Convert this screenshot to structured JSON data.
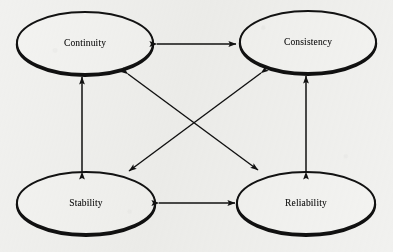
{
  "diagram": {
    "background_color": "#f1f1ef",
    "stroke_color": "#111111",
    "text_color": "#151515",
    "nodes": [
      {
        "id": "continuity",
        "label": "Continuity",
        "cx": 85,
        "cy": 43,
        "rx": 68,
        "ry": 31
      },
      {
        "id": "consistency",
        "label": "Consistency",
        "cx": 308,
        "cy": 42,
        "rx": 68,
        "ry": 31
      },
      {
        "id": "stability",
        "label": "Stability",
        "cx": 86,
        "cy": 203,
        "rx": 69,
        "ry": 31
      },
      {
        "id": "reliability",
        "label": "Reliability",
        "cx": 306,
        "cy": 203,
        "rx": 69,
        "ry": 31
      }
    ],
    "edges": [
      {
        "id": "continuity-consistency",
        "from": "continuity",
        "to": "consistency",
        "arrowheads": "both",
        "orientation": "horizontal-top"
      },
      {
        "id": "stability-reliability",
        "from": "stability",
        "to": "reliability",
        "arrowheads": "both",
        "orientation": "horizontal-bottom"
      },
      {
        "id": "continuity-stability",
        "from": "continuity",
        "to": "stability",
        "arrowheads": "both",
        "orientation": "vertical-left"
      },
      {
        "id": "consistency-reliability",
        "from": "consistency",
        "to": "reliability",
        "arrowheads": "both",
        "orientation": "vertical-right"
      },
      {
        "id": "continuity-reliability",
        "from": "continuity",
        "to": "reliability",
        "arrowheads": "both",
        "orientation": "diagonal-down-right"
      },
      {
        "id": "consistency-stability",
        "from": "consistency",
        "to": "stability",
        "arrowheads": "both",
        "orientation": "diagonal-down-left"
      }
    ]
  }
}
